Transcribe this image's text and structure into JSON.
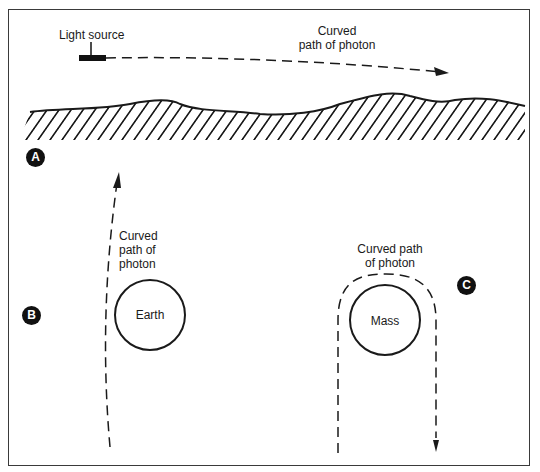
{
  "diagram": {
    "panels": [
      {
        "id": "A",
        "badge": "A",
        "light_source_label": "Light source",
        "path_label_line1": "Curved",
        "path_label_line2": "path of photon"
      },
      {
        "id": "B",
        "badge": "B",
        "path_label_line1": "Curved",
        "path_label_line2": "path of",
        "path_label_line3": "photon",
        "body_label": "Earth"
      },
      {
        "id": "C",
        "badge": "C",
        "path_label_line1": "Curved path",
        "path_label_line2": "of photon",
        "body_label": "Mass"
      }
    ],
    "colors": {
      "ink": "#1a1a1a",
      "background": "#ffffff"
    }
  }
}
